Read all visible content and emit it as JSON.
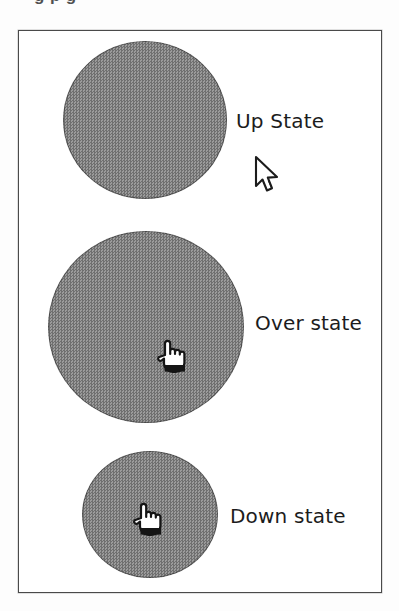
{
  "figure": {
    "cropped_caption_text": "g p g",
    "background_color": "#ffffff",
    "frame_border_color": "#4a4a4a",
    "circle_fill_color": "#8a8a8a"
  },
  "states": [
    {
      "id": "up",
      "label": "Up State",
      "circle_diameter_px": 160,
      "cursor": "arrow-cursor",
      "cursor_inside_circle": false
    },
    {
      "id": "over",
      "label": "Over state",
      "circle_diameter_px": 193,
      "cursor": "pointing-hand-cursor",
      "cursor_inside_circle": true
    },
    {
      "id": "down",
      "label": "Down state",
      "circle_diameter_px": 133,
      "cursor": "pointing-hand-cursor",
      "cursor_inside_circle": true
    }
  ]
}
